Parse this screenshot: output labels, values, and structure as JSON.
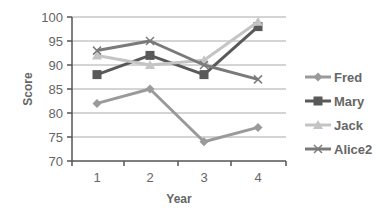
{
  "chart_data": {
    "type": "line",
    "title": "",
    "xlabel": "Year",
    "ylabel": "Score",
    "categories": [
      "1",
      "2",
      "3",
      "4"
    ],
    "ylim": [
      70,
      100
    ],
    "yticks": [
      70,
      75,
      80,
      85,
      90,
      95,
      100
    ],
    "grid": true,
    "legend_position": "right",
    "series": [
      {
        "name": "Fred",
        "values": [
          82,
          85,
          74,
          77
        ],
        "color": "#9a9a9a",
        "marker": "diamond"
      },
      {
        "name": "Mary",
        "values": [
          88,
          92,
          88,
          98
        ],
        "color": "#595959",
        "marker": "square"
      },
      {
        "name": "Jack",
        "values": [
          92,
          90,
          91,
          99
        ],
        "color": "#c4c4c4",
        "marker": "triangle"
      },
      {
        "name": "Alice2",
        "values": [
          93,
          95,
          90,
          87
        ],
        "color": "#7a7a7a",
        "marker": "x"
      }
    ]
  },
  "colors": {
    "axis": "#555555",
    "grid": "#aaaaaa",
    "text": "#666666"
  }
}
